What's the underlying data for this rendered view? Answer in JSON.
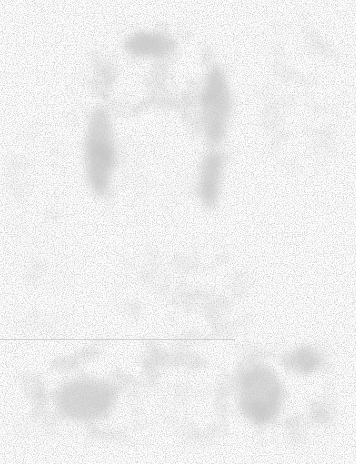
{
  "image": {
    "description": "Faded, heavily noised grayscale portrait photocopy: ghostly head with dark hair outline in upper-center, shoulders and torso along the bottom, faint horizontal scan line across lower third",
    "palette": {
      "background": "#fdfdfd",
      "light_gray": "#e4e4e4",
      "mid_gray": "#cfcfcf",
      "dark_gray": "#b8b8b8",
      "line": "#c8c8c8"
    },
    "regions": [
      {
        "name": "hair-outline",
        "x": 75,
        "y": 25,
        "w": 160,
        "h": 195
      },
      {
        "name": "face",
        "x": 110,
        "y": 80,
        "w": 95,
        "h": 140
      },
      {
        "name": "right-background-blob",
        "x": 265,
        "y": 20,
        "w": 80,
        "h": 150
      },
      {
        "name": "neck-collar",
        "x": 120,
        "y": 250,
        "w": 130,
        "h": 90
      },
      {
        "name": "torso",
        "x": 20,
        "y": 340,
        "w": 310,
        "h": 100
      },
      {
        "name": "scan-line",
        "x": 0,
        "y": 339,
        "w": 235,
        "h": 1
      }
    ]
  }
}
